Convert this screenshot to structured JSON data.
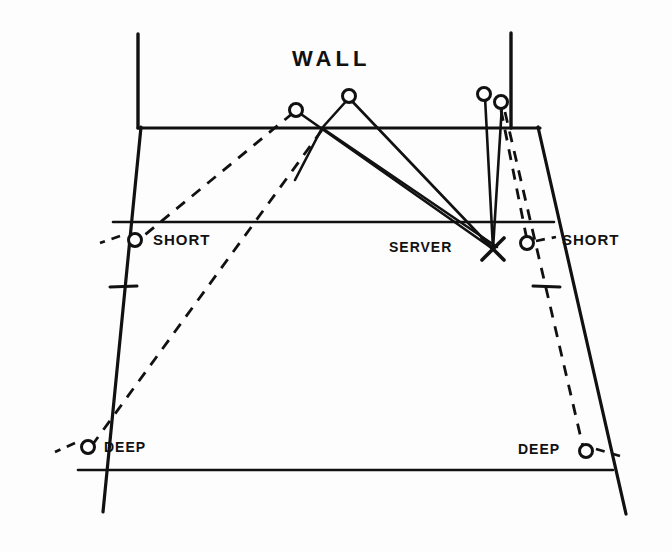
{
  "figure": {
    "kind": "hand-drawn badminton/squash court service diagram",
    "background_color": "#fdfdfd",
    "ink_color": "#111111"
  },
  "labels": {
    "wall": "WALL",
    "short_left": "SHORT",
    "short_right": "SHORT",
    "deep_left": "DEEP",
    "deep_right": "DEEP",
    "server": "SERVER"
  },
  "markers": {
    "server_x": {
      "name": "server-position",
      "glyph": "X",
      "x": 493,
      "y": 249
    },
    "targets": [
      {
        "name": "wall-target-left",
        "glyph": "o",
        "x": 296,
        "y": 110
      },
      {
        "name": "wall-target-mid",
        "glyph": "o",
        "x": 349,
        "y": 96
      },
      {
        "name": "wall-target-right-a",
        "glyph": "o",
        "x": 484,
        "y": 94
      },
      {
        "name": "wall-target-right-b",
        "glyph": "o",
        "x": 501,
        "y": 102
      },
      {
        "name": "short-target-left",
        "glyph": "o",
        "x": 135,
        "y": 240
      },
      {
        "name": "short-target-right",
        "glyph": "o",
        "x": 527,
        "y": 243
      },
      {
        "name": "deep-target-left",
        "glyph": "o",
        "x": 88,
        "y": 447
      },
      {
        "name": "deep-target-right",
        "glyph": "o",
        "x": 586,
        "y": 451
      }
    ]
  },
  "court": {
    "wall_base_line": {
      "x1": 138,
      "y1": 128,
      "x2": 540,
      "y2": 128
    },
    "wall_post_left": {
      "x1": 138,
      "y1": 34,
      "x2": 138,
      "y2": 128
    },
    "wall_post_right": {
      "x1": 511,
      "y1": 33,
      "x2": 511,
      "y2": 128
    },
    "sideline_left": {
      "x1": 141,
      "y1": 127,
      "x2": 103,
      "y2": 512
    },
    "sideline_right": {
      "x1": 538,
      "y1": 127,
      "x2": 626,
      "y2": 514
    },
    "short_service_line": {
      "x1": 113,
      "y1": 222,
      "x2": 554,
      "y2": 222
    },
    "back_line": {
      "x1": 78,
      "y1": 470,
      "x2": 613,
      "y2": 470
    },
    "tick_left": {
      "x1": 110,
      "y1": 287,
      "x2": 137,
      "y2": 286
    },
    "tick_right": {
      "x1": 533,
      "y1": 286,
      "x2": 560,
      "y2": 287
    }
  },
  "trajectories": {
    "solid_shots": [
      {
        "name": "serve-to-wall-mid",
        "points": "493,249 349,98"
      },
      {
        "name": "rebound-from-wall-mid",
        "points": "349,98 322,128 295,180"
      },
      {
        "name": "serve-to-wall-left",
        "points": "493,249 298,112"
      },
      {
        "name": "serve-to-wall-right-a",
        "points": "493,249 485,97"
      },
      {
        "name": "serve-to-wall-right-b",
        "points": "493,249 502,105"
      },
      {
        "name": "rebound-long-right",
        "points": "322,128 497,247"
      }
    ],
    "dashed_shots": [
      {
        "name": "rebound-to-short-left",
        "points": "293,113 141,238"
      },
      {
        "name": "rebound-to-deep-left",
        "points": "322,130 93,444"
      },
      {
        "name": "rebound-to-short-right",
        "points": "501,110 527,240"
      },
      {
        "name": "rebound-to-deep-right",
        "points": "505,112 583,447"
      }
    ],
    "short_ticks": [
      {
        "name": "flick-short-left",
        "points": "120,236 100,243"
      },
      {
        "name": "flick-short-right",
        "points": "536,241 556,237"
      },
      {
        "name": "flick-deep-left",
        "points": "75,443 55,452"
      },
      {
        "name": "flick-deep-right",
        "points": "596,449 620,456"
      }
    ]
  },
  "style": {
    "stroke_width_court": 3,
    "stroke_width_traj": 2.6,
    "dash_pattern": "11 9",
    "marker_radius": 6.5
  }
}
